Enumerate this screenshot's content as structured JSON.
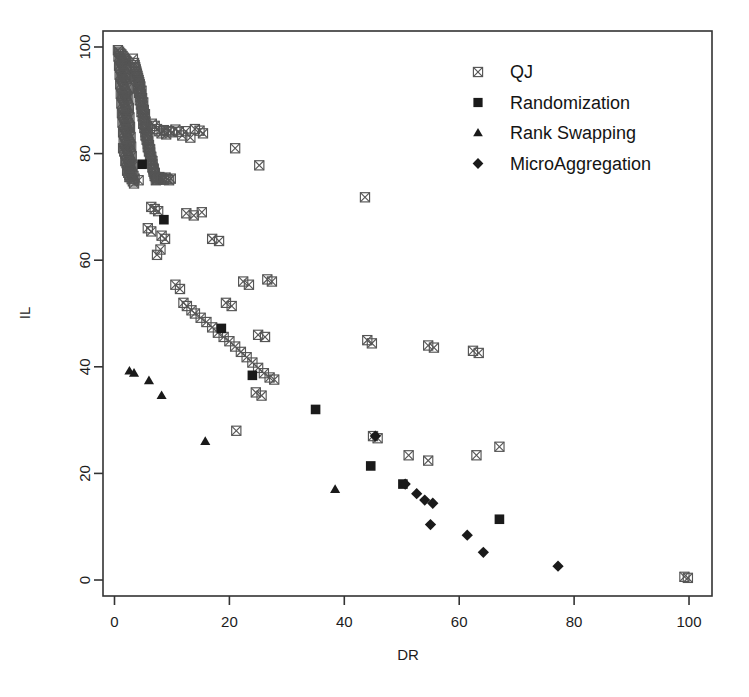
{
  "chart_data": {
    "type": "scatter",
    "title": "",
    "xlabel": "DR",
    "ylabel": "IL",
    "xlim": [
      -2,
      104
    ],
    "ylim": [
      -3,
      103
    ],
    "xticks": [
      0,
      20,
      40,
      60,
      80,
      100
    ],
    "yticks": [
      0,
      20,
      40,
      60,
      80,
      100
    ],
    "grid": false,
    "legend_position": "top-right",
    "series": [
      {
        "name": "QJ",
        "marker": "crossed-square",
        "color": "#555555",
        "points": [
          [
            0.6,
            99.4
          ],
          [
            0.8,
            99.1
          ],
          [
            1.0,
            98.8
          ],
          [
            1.2,
            98.6
          ],
          [
            1.4,
            98.3
          ],
          [
            1.6,
            98.0
          ],
          [
            1.8,
            97.7
          ],
          [
            2.0,
            97.4
          ],
          [
            0.7,
            98.2
          ],
          [
            0.9,
            97.9
          ],
          [
            1.1,
            97.5
          ],
          [
            1.3,
            97.2
          ],
          [
            1.5,
            96.9
          ],
          [
            1.7,
            96.6
          ],
          [
            1.9,
            96.2
          ],
          [
            2.1,
            95.9
          ],
          [
            0.8,
            96.5
          ],
          [
            1.0,
            96.1
          ],
          [
            1.2,
            95.8
          ],
          [
            1.4,
            95.4
          ],
          [
            1.6,
            95.1
          ],
          [
            1.8,
            94.8
          ],
          [
            2.0,
            94.4
          ],
          [
            2.2,
            94.1
          ],
          [
            0.9,
            94.8
          ],
          [
            1.1,
            94.4
          ],
          [
            1.3,
            94.0
          ],
          [
            1.5,
            93.7
          ],
          [
            1.7,
            93.3
          ],
          [
            1.9,
            93.0
          ],
          [
            2.1,
            92.6
          ],
          [
            2.3,
            92.3
          ],
          [
            1.0,
            93.0
          ],
          [
            1.2,
            92.6
          ],
          [
            1.4,
            92.3
          ],
          [
            1.6,
            91.9
          ],
          [
            1.8,
            91.5
          ],
          [
            2.0,
            91.2
          ],
          [
            2.2,
            90.8
          ],
          [
            2.4,
            90.5
          ],
          [
            1.1,
            91.2
          ],
          [
            1.3,
            90.8
          ],
          [
            1.5,
            90.5
          ],
          [
            1.7,
            90.1
          ],
          [
            1.9,
            89.7
          ],
          [
            2.1,
            89.4
          ],
          [
            2.3,
            89.0
          ],
          [
            2.5,
            88.6
          ],
          [
            1.2,
            89.4
          ],
          [
            1.4,
            89.0
          ],
          [
            1.6,
            88.6
          ],
          [
            1.8,
            88.3
          ],
          [
            2.0,
            87.9
          ],
          [
            2.2,
            87.5
          ],
          [
            2.4,
            87.2
          ],
          [
            2.6,
            86.8
          ],
          [
            1.3,
            87.6
          ],
          [
            1.5,
            87.2
          ],
          [
            1.7,
            86.8
          ],
          [
            1.9,
            86.5
          ],
          [
            2.1,
            86.1
          ],
          [
            2.3,
            85.7
          ],
          [
            2.5,
            85.3
          ],
          [
            2.7,
            85.0
          ],
          [
            1.4,
            85.8
          ],
          [
            1.6,
            85.4
          ],
          [
            1.8,
            85.0
          ],
          [
            2.0,
            84.6
          ],
          [
            2.2,
            84.3
          ],
          [
            2.4,
            83.9
          ],
          [
            2.6,
            83.5
          ],
          [
            2.8,
            83.1
          ],
          [
            1.5,
            84.0
          ],
          [
            1.7,
            83.6
          ],
          [
            1.9,
            83.2
          ],
          [
            2.1,
            82.8
          ],
          [
            2.3,
            82.4
          ],
          [
            2.5,
            82.1
          ],
          [
            2.7,
            81.7
          ],
          [
            2.9,
            81.3
          ],
          [
            1.6,
            82.2
          ],
          [
            1.8,
            81.8
          ],
          [
            2.0,
            81.4
          ],
          [
            2.2,
            81.0
          ],
          [
            2.4,
            80.6
          ],
          [
            2.6,
            80.2
          ],
          [
            2.8,
            79.9
          ],
          [
            3.0,
            79.5
          ],
          [
            1.7,
            80.4
          ],
          [
            1.9,
            80.0
          ],
          [
            2.1,
            79.6
          ],
          [
            2.3,
            79.2
          ],
          [
            2.5,
            78.8
          ],
          [
            2.7,
            78.4
          ],
          [
            2.9,
            78.0
          ],
          [
            3.1,
            77.6
          ],
          [
            1.9,
            78.6
          ],
          [
            2.1,
            78.2
          ],
          [
            2.3,
            77.8
          ],
          [
            2.5,
            77.4
          ],
          [
            2.7,
            77.0
          ],
          [
            2.9,
            76.6
          ],
          [
            3.1,
            76.2
          ],
          [
            3.3,
            75.8
          ],
          [
            2.2,
            76.8
          ],
          [
            2.4,
            76.4
          ],
          [
            2.6,
            76.0
          ],
          [
            2.8,
            75.6
          ],
          [
            3.0,
            75.2
          ],
          [
            3.2,
            74.8
          ],
          [
            3.4,
            74.4
          ],
          [
            3.2,
            97.8
          ],
          [
            3.4,
            97.0
          ],
          [
            3.6,
            96.2
          ],
          [
            3.8,
            95.4
          ],
          [
            4.0,
            94.6
          ],
          [
            4.2,
            93.8
          ],
          [
            4.4,
            93.0
          ],
          [
            3.5,
            96.6
          ],
          [
            3.7,
            95.8
          ],
          [
            3.9,
            95.0
          ],
          [
            4.1,
            94.2
          ],
          [
            4.3,
            93.4
          ],
          [
            4.5,
            92.6
          ],
          [
            4.7,
            91.8
          ],
          [
            3.8,
            94.4
          ],
          [
            4.0,
            93.6
          ],
          [
            4.2,
            92.8
          ],
          [
            4.4,
            92.0
          ],
          [
            4.6,
            91.2
          ],
          [
            4.8,
            90.4
          ],
          [
            5.0,
            89.6
          ],
          [
            4.1,
            92.2
          ],
          [
            4.3,
            91.4
          ],
          [
            4.5,
            90.6
          ],
          [
            4.7,
            89.8
          ],
          [
            4.9,
            89.0
          ],
          [
            5.1,
            88.2
          ],
          [
            5.3,
            87.4
          ],
          [
            4.4,
            90.0
          ],
          [
            4.6,
            89.2
          ],
          [
            4.8,
            88.4
          ],
          [
            5.0,
            87.6
          ],
          [
            5.2,
            86.8
          ],
          [
            5.4,
            86.0
          ],
          [
            5.6,
            85.2
          ],
          [
            4.7,
            87.8
          ],
          [
            4.9,
            87.0
          ],
          [
            5.1,
            86.2
          ],
          [
            5.3,
            85.4
          ],
          [
            5.5,
            84.6
          ],
          [
            5.7,
            83.8
          ],
          [
            5.9,
            83.0
          ],
          [
            5.0,
            85.6
          ],
          [
            5.2,
            84.8
          ],
          [
            5.4,
            84.0
          ],
          [
            5.6,
            83.2
          ],
          [
            5.8,
            82.4
          ],
          [
            6.0,
            81.6
          ],
          [
            6.2,
            80.8
          ],
          [
            5.4,
            83.4
          ],
          [
            5.6,
            82.6
          ],
          [
            5.8,
            81.8
          ],
          [
            6.0,
            81.0
          ],
          [
            6.2,
            80.2
          ],
          [
            6.4,
            79.4
          ],
          [
            6.6,
            78.6
          ],
          [
            5.8,
            81.2
          ],
          [
            6.0,
            80.4
          ],
          [
            6.2,
            79.6
          ],
          [
            6.4,
            78.8
          ],
          [
            6.6,
            78.0
          ],
          [
            6.8,
            77.2
          ],
          [
            7.0,
            76.4
          ],
          [
            6.2,
            79.0
          ],
          [
            6.4,
            78.2
          ],
          [
            6.6,
            77.4
          ],
          [
            6.8,
            76.6
          ],
          [
            7.0,
            75.8
          ],
          [
            7.2,
            75.0
          ],
          [
            7.4,
            75.4
          ],
          [
            6.8,
            77.0
          ],
          [
            7.0,
            76.2
          ],
          [
            7.2,
            75.6
          ],
          [
            7.4,
            75.1
          ],
          [
            7.6,
            75.3
          ],
          [
            7.8,
            75.6
          ],
          [
            8.0,
            75.2
          ],
          [
            8.3,
            75.4
          ],
          [
            8.6,
            75.1
          ],
          [
            8.9,
            75.5
          ],
          [
            9.2,
            75.2
          ],
          [
            9.5,
            75.0
          ],
          [
            9.8,
            75.3
          ],
          [
            6.5,
            85.6
          ],
          [
            7.0,
            85.2
          ],
          [
            7.4,
            84.6
          ],
          [
            7.8,
            84.2
          ],
          [
            8.2,
            83.8
          ],
          [
            8.6,
            84.4
          ],
          [
            9.0,
            83.6
          ],
          [
            9.5,
            84.2
          ],
          [
            10.0,
            84.0
          ],
          [
            10.6,
            84.5
          ],
          [
            11.2,
            84.1
          ],
          [
            11.8,
            83.4
          ],
          [
            12.4,
            84.2
          ],
          [
            13.2,
            83.0
          ],
          [
            14.0,
            84.6
          ],
          [
            14.8,
            84.3
          ],
          [
            15.4,
            83.8
          ],
          [
            1.5,
            81.0
          ],
          [
            2.0,
            78.6
          ],
          [
            2.6,
            75.6
          ],
          [
            3.5,
            75.3
          ],
          [
            4.2,
            75.0
          ],
          [
            6.4,
            70.0
          ],
          [
            7.0,
            69.6
          ],
          [
            7.6,
            69.2
          ],
          [
            5.8,
            66.0
          ],
          [
            6.4,
            65.4
          ],
          [
            8.2,
            64.6
          ],
          [
            8.8,
            64.0
          ],
          [
            7.4,
            61.0
          ],
          [
            8.0,
            62.0
          ],
          [
            12.5,
            68.8
          ],
          [
            13.8,
            68.4
          ],
          [
            15.2,
            69.0
          ],
          [
            17.0,
            64.0
          ],
          [
            18.2,
            63.6
          ],
          [
            10.6,
            55.4
          ],
          [
            11.4,
            54.6
          ],
          [
            12.0,
            52.0
          ],
          [
            12.6,
            51.4
          ],
          [
            13.4,
            50.6
          ],
          [
            14.0,
            50.0
          ],
          [
            15.0,
            49.2
          ],
          [
            16.0,
            48.4
          ],
          [
            17.0,
            47.4
          ],
          [
            18.0,
            46.4
          ],
          [
            19.0,
            45.6
          ],
          [
            20.0,
            44.8
          ],
          [
            21.0,
            43.8
          ],
          [
            22.0,
            42.8
          ],
          [
            23.0,
            41.8
          ],
          [
            24.0,
            40.8
          ],
          [
            25.0,
            39.8
          ],
          [
            26.0,
            38.8
          ],
          [
            22.4,
            56.0
          ],
          [
            23.4,
            55.4
          ],
          [
            26.6,
            56.4
          ],
          [
            27.4,
            56.0
          ],
          [
            25.0,
            46.0
          ],
          [
            26.2,
            45.6
          ],
          [
            21.0,
            81.0
          ],
          [
            25.2,
            77.8
          ],
          [
            19.4,
            52.0
          ],
          [
            20.4,
            51.4
          ],
          [
            27.0,
            38.0
          ],
          [
            27.8,
            37.6
          ],
          [
            24.6,
            35.2
          ],
          [
            25.6,
            34.6
          ],
          [
            21.2,
            28.0
          ],
          [
            44.0,
            45.0
          ],
          [
            44.8,
            44.4
          ],
          [
            43.6,
            71.8
          ],
          [
            54.6,
            44.0
          ],
          [
            55.6,
            43.6
          ],
          [
            62.4,
            43.0
          ],
          [
            63.4,
            42.6
          ],
          [
            51.2,
            23.4
          ],
          [
            54.6,
            22.4
          ],
          [
            63.0,
            23.4
          ],
          [
            67.0,
            25.0
          ],
          [
            45.0,
            27.0
          ],
          [
            45.8,
            26.6
          ],
          [
            99.2,
            0.6
          ],
          [
            99.8,
            0.4
          ]
        ]
      },
      {
        "name": "Randomization",
        "marker": "filled-square",
        "color": "#1a1a1a",
        "points": [
          [
            4.8,
            78.0
          ],
          [
            8.6,
            67.6
          ],
          [
            18.6,
            47.2
          ],
          [
            24.0,
            38.4
          ],
          [
            35.0,
            32.0
          ],
          [
            44.6,
            21.4
          ],
          [
            50.2,
            18.0
          ],
          [
            67.0,
            11.4
          ]
        ]
      },
      {
        "name": "Rank Swapping",
        "marker": "filled-triangle",
        "color": "#1a1a1a",
        "points": [
          [
            2.6,
            39.2
          ],
          [
            3.4,
            38.8
          ],
          [
            6.0,
            37.4
          ],
          [
            8.2,
            34.6
          ],
          [
            15.8,
            26.0
          ],
          [
            38.4,
            17.0
          ]
        ]
      },
      {
        "name": "MicroAggregation",
        "marker": "filled-diamond",
        "color": "#1a1a1a",
        "points": [
          [
            45.4,
            27.0
          ],
          [
            50.6,
            18.0
          ],
          [
            52.6,
            16.2
          ],
          [
            54.0,
            15.0
          ],
          [
            55.4,
            14.4
          ],
          [
            55.0,
            10.4
          ],
          [
            61.4,
            8.4
          ],
          [
            64.2,
            5.2
          ],
          [
            77.2,
            2.6
          ]
        ]
      }
    ]
  },
  "legend": {
    "entries": [
      {
        "label": "QJ",
        "marker": "crossed-square"
      },
      {
        "label": "Randomization",
        "marker": "filled-square"
      },
      {
        "label": "Rank Swapping",
        "marker": "filled-triangle"
      },
      {
        "label": "MicroAggregation",
        "marker": "filled-diamond"
      }
    ]
  },
  "axes": {
    "x_label": "DR",
    "y_label": "IL",
    "x_tick_labels": [
      "0",
      "20",
      "40",
      "60",
      "80",
      "100"
    ],
    "y_tick_labels": [
      "0",
      "20",
      "40",
      "60",
      "80",
      "100"
    ]
  },
  "colors": {
    "qj": "#555555",
    "solid": "#1a1a1a",
    "frame": "#333333",
    "background": "#ffffff"
  }
}
